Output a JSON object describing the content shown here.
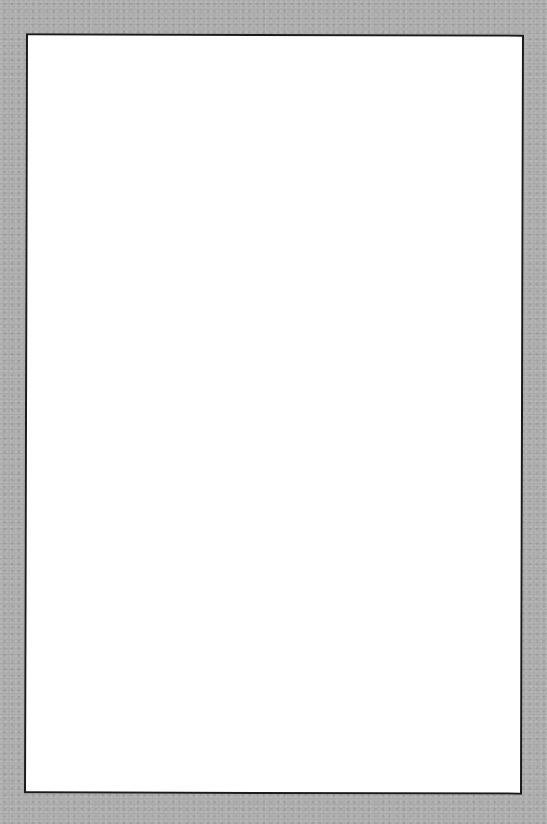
{
  "background": {
    "color": "#a9a9a9",
    "texture": "gray-paper"
  },
  "sheet": {
    "color": "#ffffff",
    "border_color": "#1a1a1a",
    "content": ""
  }
}
